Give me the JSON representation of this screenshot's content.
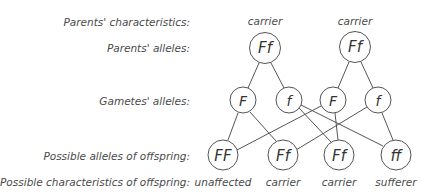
{
  "row_labels": {
    "parents_characteristics": "Parents' characteristics:",
    "parents_alleles": "Parents' alleles:",
    "gametes_alleles": "Gametes' alleles:",
    "offspring_alleles": "Possible alleles of offspring:",
    "offspring_characteristics": "Possible characteristics of offspring:"
  },
  "parents": [
    {
      "characteristic": "carrier",
      "alleles": "Ff"
    },
    {
      "characteristic": "carrier",
      "alleles": "Ff"
    }
  ],
  "gametes": [
    {
      "allele": "F",
      "parent": 0
    },
    {
      "allele": "f",
      "parent": 0
    },
    {
      "allele": "F",
      "parent": 1
    },
    {
      "allele": "f",
      "parent": 1
    }
  ],
  "offspring": [
    {
      "alleles": "FF",
      "characteristic": "unaffected"
    },
    {
      "alleles": "Ff",
      "characteristic": "carrier"
    },
    {
      "alleles": "Ff",
      "characteristic": "carrier"
    },
    {
      "alleles": "ff",
      "characteristic": "sufferer"
    }
  ],
  "gamete_to_offspring_links": [
    [
      0,
      0
    ],
    [
      0,
      1
    ],
    [
      1,
      2
    ],
    [
      1,
      3
    ],
    [
      2,
      0
    ],
    [
      2,
      2
    ],
    [
      3,
      1
    ],
    [
      3,
      3
    ]
  ],
  "colors": {
    "line": "#555555",
    "text": "#4a4a4a",
    "background": "#ffffff"
  }
}
